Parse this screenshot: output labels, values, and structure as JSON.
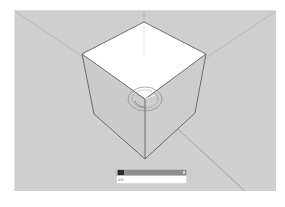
{
  "app": {
    "type": "3d-modeling-viewport",
    "background_color": "#cfcfcf"
  },
  "scene": {
    "object": "cube",
    "cube": {
      "top_face_color": "#ffffff",
      "side_face_color": "#cdcdcd",
      "edge_color": "#505050",
      "vertices": {
        "top": [
          143,
          21
        ],
        "left_top": [
          81,
          53
        ],
        "right_top": [
          205,
          53
        ],
        "front_top": [
          144,
          98
        ],
        "left_bottom": [
          93,
          113
        ],
        "right_bottom": [
          194,
          112
        ],
        "front_bottom": [
          144,
          158
        ]
      }
    },
    "axes": {
      "color": "#a9a9a9",
      "vertical_axis_icon": "blue-axis-line",
      "diagonal_axis_icon": "red-green-axis-lines"
    },
    "tool_cursor": {
      "icon": "protractor-icon",
      "center": [
        144,
        98
      ],
      "color": "#7a7a7a"
    }
  },
  "measurements_box": {
    "label": "Angle",
    "value": "0.0"
  }
}
